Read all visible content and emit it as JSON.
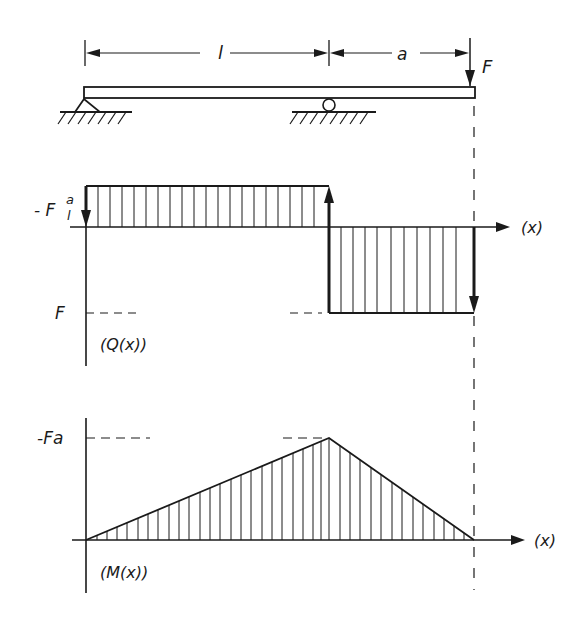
{
  "beam": {
    "dimension_l": "l",
    "dimension_a": "a",
    "force_label": "F",
    "supports": [
      "pin-support",
      "roller-support"
    ]
  },
  "shear_diagram": {
    "label_top": "- F",
    "label_top_frac_num": "a",
    "label_top_frac_den": "l",
    "label_bottom": "F",
    "axis_label": "(x)",
    "ordinate_label": "(Q(x))"
  },
  "moment_diagram": {
    "label_peak": "-Fa",
    "axis_label": "(x)",
    "ordinate_label": "(M(x))"
  },
  "colors": {
    "ink": "#1a1a1a",
    "background": "#ffffff"
  }
}
